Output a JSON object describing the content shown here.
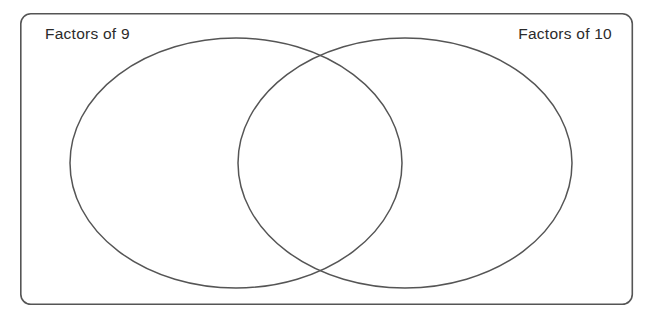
{
  "worksheet": {
    "type": "venn-diagram",
    "background_color": "#ffffff",
    "stroke_color": "#555555",
    "text_color": "#2b2b2b",
    "outer_box": {
      "x": 20,
      "y": 13,
      "width": 613,
      "height": 292,
      "corner_radius": 10,
      "stroke_width": 1.6
    },
    "left_label": "Factors of 9",
    "right_label": "Factors of 10",
    "left_circle": {
      "name": "factors-of-9-set",
      "cx": 236,
      "cy": 163,
      "rx": 166,
      "ry": 125,
      "stroke_width": 1.5
    },
    "right_circle": {
      "name": "factors-of-10-set",
      "cx": 405,
      "cy": 163,
      "rx": 167,
      "ry": 125,
      "stroke_width": 1.5
    },
    "left_label_pos": {
      "x": 45,
      "y": 39
    },
    "right_label_pos": {
      "x": 612,
      "y": 39
    },
    "left_only_items": [],
    "intersection_items": [],
    "right_only_items": [],
    "outside_items": []
  }
}
